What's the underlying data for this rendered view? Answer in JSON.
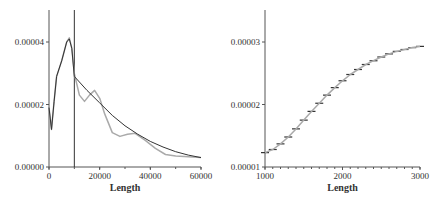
{
  "chart_data": [
    {
      "type": "line",
      "title": "",
      "xlabel": "Length",
      "ylabel": "",
      "xlim": [
        0,
        60000
      ],
      "ylim": [
        0,
        5e-05
      ],
      "xticks": [
        "0",
        "20000",
        "40000",
        "60000"
      ],
      "yticks": [
        "0.00000",
        "0.00002",
        "0.00004"
      ],
      "vline_x": 10000,
      "series": [
        {
          "name": "empirical density (gray)",
          "color": "#aaaaaa",
          "x": [
            0,
            1000,
            2000,
            3000,
            5000,
            7000,
            8000,
            9000,
            10000,
            12000,
            14000,
            16000,
            18000,
            20000,
            22000,
            25000,
            28000,
            31000,
            34000,
            38000,
            42000,
            46000,
            50000,
            55000,
            60000
          ],
          "y": [
            1.9e-05,
            1.2e-05,
            2.1e-05,
            2.9e-05,
            3.4e-05,
            4e-05,
            4.13e-05,
            3.8e-05,
            3e-05,
            2.3e-05,
            2.1e-05,
            2.3e-05,
            2.45e-05,
            2.2e-05,
            1.7e-05,
            1.1e-05,
            9.8e-06,
            1.05e-05,
            1.08e-05,
            8.5e-06,
            6e-06,
            4e-06,
            3.5e-06,
            3.3e-06,
            3e-06
          ]
        },
        {
          "name": "fitted density (black)",
          "color": "#333333",
          "x": [
            0,
            1000,
            2000,
            3000,
            5000,
            7000,
            8000,
            9000,
            10000,
            15000,
            20000,
            25000,
            30000,
            35000,
            40000,
            45000,
            50000,
            55000,
            60000
          ],
          "y": [
            1.9e-05,
            1.2e-05,
            2.1e-05,
            2.9e-05,
            3.4e-05,
            4e-05,
            4.1e-05,
            3.8e-05,
            2.9e-05,
            2.45e-05,
            2.05e-05,
            1.65e-05,
            1.32e-05,
            1.05e-05,
            8.2e-06,
            6.4e-06,
            4.9e-06,
            3.8e-06,
            3e-06
          ]
        }
      ]
    },
    {
      "type": "line",
      "title": "",
      "xlabel": "Length",
      "ylabel": "",
      "xlim": [
        1000,
        3000
      ],
      "ylim": [
        1e-05,
        3.5e-05
      ],
      "xticks": [
        "1000",
        "2000",
        "3000"
      ],
      "yticks": [
        "0.00001",
        "0.00002",
        "0.00003"
      ],
      "series": [
        {
          "name": "step segments (black)",
          "color": "#333333",
          "x": [
            1000,
            1100,
            1200,
            1300,
            1400,
            1500,
            1600,
            1700,
            1800,
            1900,
            2000,
            2100,
            2200,
            2300,
            2400,
            2500,
            2600,
            2700,
            2800,
            2900,
            3000
          ],
          "y": [
            1.23e-05,
            1.28e-05,
            1.37e-05,
            1.48e-05,
            1.61e-05,
            1.75e-05,
            1.89e-05,
            2.02e-05,
            2.15e-05,
            2.27e-05,
            2.38e-05,
            2.48e-05,
            2.56e-05,
            2.64e-05,
            2.7e-05,
            2.76e-05,
            2.81e-05,
            2.85e-05,
            2.88e-05,
            2.91e-05,
            2.93e-05
          ]
        },
        {
          "name": "smooth curve (gray)",
          "color": "#aaaaaa",
          "x": [
            1000,
            1100,
            1200,
            1300,
            1400,
            1500,
            1600,
            1700,
            1800,
            1900,
            2000,
            2100,
            2200,
            2300,
            2400,
            2500,
            2600,
            2700,
            2800,
            2900,
            3000
          ],
          "y": [
            1.23e-05,
            1.28e-05,
            1.37e-05,
            1.48e-05,
            1.61e-05,
            1.75e-05,
            1.89e-05,
            2.02e-05,
            2.15e-05,
            2.27e-05,
            2.38e-05,
            2.48e-05,
            2.56e-05,
            2.64e-05,
            2.7e-05,
            2.76e-05,
            2.81e-05,
            2.85e-05,
            2.88e-05,
            2.91e-05,
            2.93e-05
          ]
        }
      ]
    }
  ]
}
